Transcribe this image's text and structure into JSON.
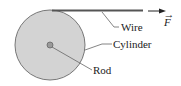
{
  "diagram": {
    "labels": {
      "wire": "Wire",
      "cylinder": "Cylinder",
      "rod": "Rod",
      "force": "F",
      "force_vector_mark": "→"
    },
    "colors": {
      "cylinder_fill": "#d3d3d3",
      "cylinder_stroke": "#777777",
      "rod_fill": "#9a9a9a",
      "wire": "#555555",
      "leader": "#666666",
      "text": "#222222"
    }
  }
}
